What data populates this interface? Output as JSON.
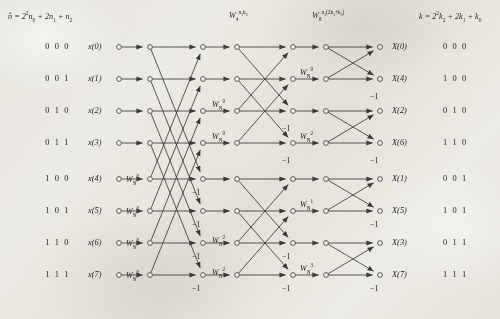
{
  "headers": [
    {
      "id": "input-index-formula",
      "html": "n&#770; = 2<sup>2</sup>n<sub>0</sub> + 2n<sub>1</sub> + n<sub>2</sub>",
      "x": 8,
      "y": 12
    },
    {
      "id": "stage2-twiddle-header",
      "html": "W<sub>4</sub><sup>n<sub>1</sub>k<sub>0</sub></sup>",
      "x": 229,
      "y": 11
    },
    {
      "id": "stage3-twiddle-header",
      "html": "W<sub>8</sub><sup>n<sub>2</sub>(2k<sub>1</sub>+k<sub>0</sub>)</sup>",
      "x": 312,
      "y": 11
    },
    {
      "id": "output-index-formula",
      "html": "k = 2<sup>2</sup>k<sub>2</sub> + 2k<sub>1</sub> + k<sub>0</sub>",
      "x": 419,
      "y": 12
    }
  ],
  "inputs": [
    {
      "bin": "0 0 0",
      "label": "x(0)"
    },
    {
      "bin": "0 0 1",
      "label": "x(1)"
    },
    {
      "bin": "0 1 0",
      "label": "x(2)"
    },
    {
      "bin": "0 1 1",
      "label": "x(3)"
    },
    {
      "bin": "1 0 0",
      "label": "x(4)"
    },
    {
      "bin": "1 0 1",
      "label": "x(5)"
    },
    {
      "bin": "1 1 0",
      "label": "x(6)"
    },
    {
      "bin": "1 1 1",
      "label": "x(7)"
    }
  ],
  "outputs": [
    {
      "label": "X(0)",
      "bin": "0 0 0"
    },
    {
      "label": "X(4)",
      "bin": "1 0 0"
    },
    {
      "label": "X(2)",
      "bin": "0 1 0"
    },
    {
      "label": "X(6)",
      "bin": "1 1 0"
    },
    {
      "label": "X(1)",
      "bin": "0 0 1"
    },
    {
      "label": "X(5)",
      "bin": "1 0 1"
    },
    {
      "label": "X(3)",
      "bin": "0 1 1"
    },
    {
      "label": "X(7)",
      "bin": "1 1 1"
    }
  ],
  "twiddles": [
    {
      "id": "tw-s1-r4",
      "stage": 1,
      "row": 4,
      "exp": "0",
      "html": "W<sub>N</sub><sup>0</sup>",
      "x": 126,
      "y": 175
    },
    {
      "id": "tw-s1-r5",
      "stage": 1,
      "row": 5,
      "exp": "0",
      "html": "W<sub>N</sub><sup>0</sup>",
      "x": 126,
      "y": 207
    },
    {
      "id": "tw-s1-r6",
      "stage": 1,
      "row": 6,
      "exp": "0",
      "html": "W<sub>N</sub><sup>0</sup>",
      "x": 126,
      "y": 239
    },
    {
      "id": "tw-s1-r7",
      "stage": 1,
      "row": 7,
      "exp": "0",
      "html": "W<sub>N</sub><sup>0</sup>",
      "x": 126,
      "y": 271
    },
    {
      "id": "tw-s2-r2",
      "stage": 2,
      "row": 2,
      "exp": "0",
      "html": "W<sub>N</sub><sup>0</sup>",
      "x": 212,
      "y": 100
    },
    {
      "id": "tw-s2-r3",
      "stage": 2,
      "row": 3,
      "exp": "0",
      "html": "W<sub>N</sub><sup>0</sup>",
      "x": 212,
      "y": 132
    },
    {
      "id": "tw-s2-r6",
      "stage": 2,
      "row": 6,
      "exp": "2",
      "html": "W<sub>N</sub><sup>2</sup>",
      "x": 212,
      "y": 236
    },
    {
      "id": "tw-s2-r7",
      "stage": 2,
      "row": 7,
      "exp": "2",
      "html": "W<sub>N</sub><sup>2</sup>",
      "x": 212,
      "y": 268
    },
    {
      "id": "tw-s3-r1",
      "stage": 3,
      "row": 1,
      "exp": "0",
      "html": "W<sub>N</sub><sup>0</sup>",
      "x": 300,
      "y": 68
    },
    {
      "id": "tw-s3-r3",
      "stage": 3,
      "row": 3,
      "exp": "2",
      "html": "W<sub>N</sub><sup>2</sup>",
      "x": 300,
      "y": 132
    },
    {
      "id": "tw-s3-r5",
      "stage": 3,
      "row": 5,
      "exp": "1",
      "html": "W<sub>N</sub><sup>1</sup>",
      "x": 300,
      "y": 200
    },
    {
      "id": "tw-s3-r7",
      "stage": 3,
      "row": 7,
      "exp": "3",
      "html": "W<sub>N</sub><sup>3</sup>",
      "x": 300,
      "y": 264
    }
  ],
  "minus_ones": [
    {
      "id": "m1-s1-r4",
      "text": "−1",
      "x": 192,
      "y": 188
    },
    {
      "id": "m1-s1-r5",
      "text": "−1",
      "x": 192,
      "y": 220
    },
    {
      "id": "m1-s1-r6",
      "text": "−1",
      "x": 192,
      "y": 252
    },
    {
      "id": "m1-s1-r7",
      "text": "−1",
      "x": 192,
      "y": 284
    },
    {
      "id": "m1-s2-r2",
      "text": "−1",
      "x": 282,
      "y": 124
    },
    {
      "id": "m1-s2-r3",
      "text": "−1",
      "x": 282,
      "y": 156
    },
    {
      "id": "m1-s2-r6",
      "text": "−1",
      "x": 282,
      "y": 252
    },
    {
      "id": "m1-s2-r7",
      "text": "−1",
      "x": 282,
      "y": 284
    },
    {
      "id": "m1-s3-r1",
      "text": "−1",
      "x": 370,
      "y": 92
    },
    {
      "id": "m1-s3-r3",
      "text": "−1",
      "x": 370,
      "y": 156
    },
    {
      "id": "m1-s3-r5",
      "text": "−1",
      "x": 370,
      "y": 220
    },
    {
      "id": "m1-s3-r7",
      "text": "−1",
      "x": 370,
      "y": 284
    }
  ],
  "chart_data": {
    "type": "diagram",
    "node_columns_x": [
      119,
      150,
      203,
      237,
      293,
      326,
      380
    ],
    "row_y": [
      47,
      79,
      111,
      143,
      179,
      211,
      243,
      275
    ],
    "stages": [
      {
        "stage": 1,
        "span": 4,
        "from_col": 1,
        "to_col": 2,
        "pairs": [
          [
            0,
            4
          ],
          [
            1,
            5
          ],
          [
            2,
            6
          ],
          [
            3,
            7
          ]
        ],
        "twiddle_rows": [
          4,
          5,
          6,
          7
        ],
        "twiddle_exps": [
          "0",
          "0",
          "0",
          "0"
        ],
        "negated_rows": [
          4,
          5,
          6,
          7
        ]
      },
      {
        "stage": 2,
        "span": 2,
        "from_col": 3,
        "to_col": 4,
        "pairs": [
          [
            0,
            2
          ],
          [
            1,
            3
          ],
          [
            4,
            6
          ],
          [
            5,
            7
          ]
        ],
        "twiddle_rows": [
          2,
          3,
          6,
          7
        ],
        "twiddle_exps": [
          "0",
          "0",
          "2",
          "2"
        ],
        "negated_rows": [
          2,
          3,
          6,
          7
        ]
      },
      {
        "stage": 3,
        "span": 1,
        "from_col": 5,
        "to_col": 6,
        "pairs": [
          [
            0,
            1
          ],
          [
            2,
            3
          ],
          [
            4,
            5
          ],
          [
            6,
            7
          ]
        ],
        "twiddle_rows": [
          1,
          3,
          5,
          7
        ],
        "twiddle_exps": [
          "0",
          "2",
          "1",
          "3"
        ],
        "negated_rows": [
          1,
          3,
          5,
          7
        ]
      }
    ],
    "input_order": [
      0,
      1,
      2,
      3,
      4,
      5,
      6,
      7
    ],
    "output_order": [
      0,
      4,
      2,
      6,
      1,
      5,
      3,
      7
    ],
    "node_count": 56,
    "line_color": "#3a3a3a",
    "node_fill": "#efece6"
  },
  "geometry": {
    "cols": [
      119,
      150,
      203,
      237,
      293,
      326,
      380
    ],
    "rows": [
      47,
      79,
      111,
      143,
      179,
      211,
      243,
      275
    ],
    "input_label_x": 88,
    "input_bin_x": 30,
    "output_label_x": 392,
    "output_bin_x": 443,
    "node_r": 2.4
  }
}
